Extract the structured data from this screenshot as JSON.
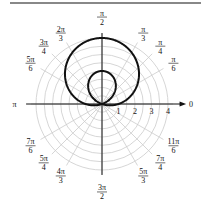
{
  "chart_data": {
    "type": "line",
    "subtype": "polar",
    "title": "",
    "equation_hint": "limaçon with inner loop",
    "series": [
      {
        "name": "r = 1 + 3 sin θ",
        "color": "#111111"
      }
    ],
    "radial_ticks": [
      "1",
      "2",
      "3",
      "4"
    ],
    "radial_range": [
      0,
      4
    ],
    "angle_labels": [
      {
        "angle_deg": 0,
        "label": "0"
      },
      {
        "angle_deg": 30,
        "label": "π/6"
      },
      {
        "angle_deg": 45,
        "label": "π/4"
      },
      {
        "angle_deg": 60,
        "label": "π/3"
      },
      {
        "angle_deg": 90,
        "label": "π/2"
      },
      {
        "angle_deg": 120,
        "label": "2π/3"
      },
      {
        "angle_deg": 135,
        "label": "3π/4"
      },
      {
        "angle_deg": 150,
        "label": "5π/6"
      },
      {
        "angle_deg": 180,
        "label": "π"
      },
      {
        "angle_deg": 210,
        "label": "7π/6"
      },
      {
        "angle_deg": 225,
        "label": "5π/4"
      },
      {
        "angle_deg": 240,
        "label": "4π/3"
      },
      {
        "angle_deg": 270,
        "label": "3π/2"
      },
      {
        "angle_deg": 300,
        "label": "5π/3"
      },
      {
        "angle_deg": 315,
        "label": "7π/4"
      },
      {
        "angle_deg": 330,
        "label": "11π/6"
      }
    ],
    "grid": true,
    "grid_color": "#cccccc",
    "curve_color": "#111111"
  }
}
